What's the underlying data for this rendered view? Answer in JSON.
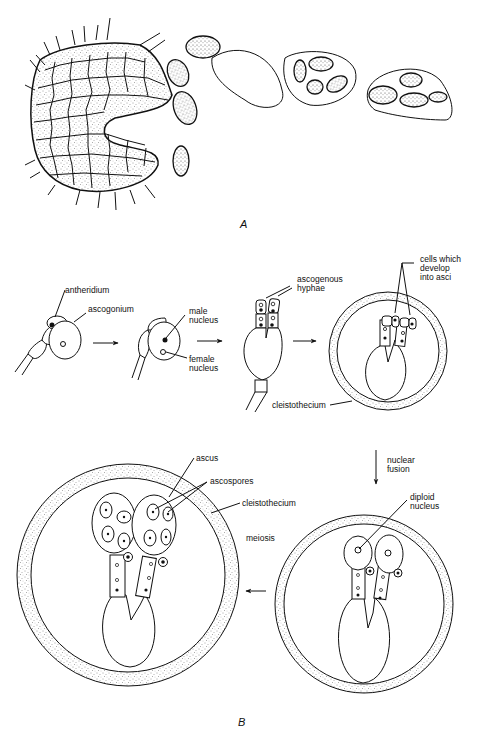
{
  "figure": {
    "panel_a_label": "A",
    "panel_b_label": "B"
  },
  "labels": {
    "antheridium": "antheridium",
    "ascogonium": "ascogonium",
    "male_nucleus_1": "male",
    "male_nucleus_2": "nucleus",
    "female_nucleus_1": "female",
    "female_nucleus_2": "nucleus",
    "ascogenous_1": "ascogenous",
    "ascogenous_2": "hyphae",
    "cells_1": "cells which",
    "cells_2": "develop",
    "cells_3": "into asci",
    "cleistothecium_1": "cleistothecium",
    "nuclear_1": "nuclear",
    "nuclear_2": "fusion",
    "diploid_1": "diploid",
    "diploid_2": "nucleus",
    "ascus": "ascus",
    "ascospores": "ascospores",
    "cleistothecium_2": "cleistothecium",
    "meiosis": "meiosis"
  },
  "colors": {
    "ink": "#111111",
    "paper": "#ffffff"
  }
}
